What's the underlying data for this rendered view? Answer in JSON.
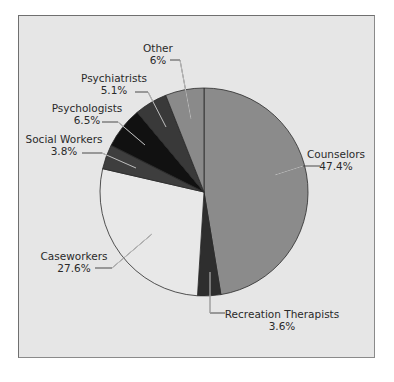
{
  "chart_data": {
    "type": "pie",
    "title": "",
    "start_angle_deg": 0,
    "direction": "clockwise",
    "center": [
      204,
      192
    ],
    "radius": 104,
    "categories": [
      "Counselors",
      "Recreation Therapists",
      "Caseworkers",
      "Social Workers",
      "Psychologists",
      "Psychiatrists",
      "Other"
    ],
    "values": [
      47.4,
      3.6,
      27.6,
      3.8,
      6.5,
      5.1,
      6.0
    ],
    "value_labels": [
      "47.4%",
      "3.6%",
      "27.6%",
      "3.8%",
      "6.5%",
      "5.1%",
      "6%"
    ],
    "colors": [
      "#8b8b8b",
      "#2e2e2e",
      "#e8e8e8",
      "#3e3e3e",
      "#111111",
      "#393939",
      "#8a8a8a"
    ],
    "labels": [
      {
        "name": "Counselors",
        "pct": "47.4%",
        "x": 336,
        "y": 158,
        "anchor": "middle",
        "line": [
          [
            275,
            175
          ],
          [
            303,
            166
          ],
          [
            320,
            166
          ]
        ]
      },
      {
        "name": "Recreation Therapists",
        "pct": "3.6%",
        "x": 282,
        "y": 318,
        "anchor": "middle",
        "line": [
          [
            210,
            272
          ],
          [
            210,
            313
          ],
          [
            225,
            313
          ]
        ]
      },
      {
        "name": "Caseworkers",
        "pct": "27.6%",
        "x": 74,
        "y": 260,
        "anchor": "middle",
        "line": [
          [
            152,
            234
          ],
          [
            112,
            268
          ],
          [
            95,
            268
          ]
        ]
      },
      {
        "name": "Social Workers",
        "pct": "3.8%",
        "x": 64,
        "y": 143,
        "anchor": "middle",
        "line": [
          [
            136,
            168
          ],
          [
            102,
            153
          ],
          [
            82,
            153
          ]
        ]
      },
      {
        "name": "Psychologists",
        "pct": "6.5%",
        "x": 87,
        "y": 112,
        "anchor": "middle",
        "line": [
          [
            145,
            145
          ],
          [
            118,
            122
          ],
          [
            102,
            122
          ]
        ]
      },
      {
        "name": "Psychiatrists",
        "pct": "5.1%",
        "x": 114,
        "y": 82,
        "anchor": "middle",
        "line": [
          [
            166,
            127
          ],
          [
            148,
            92
          ],
          [
            135,
            92
          ]
        ]
      },
      {
        "name": "Other",
        "pct": "6%",
        "x": 158,
        "y": 52,
        "anchor": "middle",
        "line": [
          [
            191,
            119
          ],
          [
            180,
            60
          ],
          [
            170,
            60
          ]
        ]
      }
    ],
    "legend": "none",
    "background": "#e6e6e6"
  }
}
